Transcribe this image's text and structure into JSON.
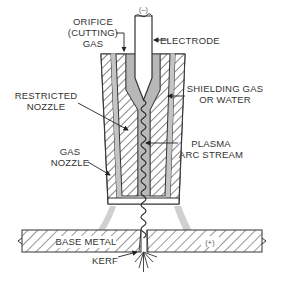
{
  "diagram": {
    "labels": {
      "orifice_line1": "ORIFICE",
      "orifice_line2": "(CUTTING)",
      "orifice_line3": "GAS",
      "electrode": "ELECTRODE",
      "electrode_polarity": "(–)",
      "restricted_line1": "RESTRICTED",
      "restricted_line2": "NOZZLE",
      "shielding_line1": "SHIELDING GAS",
      "shielding_line2": "OR WATER",
      "plasma_line1": "PLASMA",
      "plasma_line2": "ARC STREAM",
      "gas_nozzle_line1": "GAS",
      "gas_nozzle_line2": "NOZZLE",
      "base_metal": "BASE METAL",
      "base_polarity": "(+)",
      "kerf": "KERF"
    },
    "colors": {
      "line": "#333333",
      "gas_fill": "#b8b8b8",
      "shield_gas": "#d0d0d0",
      "background": "#ffffff"
    }
  }
}
